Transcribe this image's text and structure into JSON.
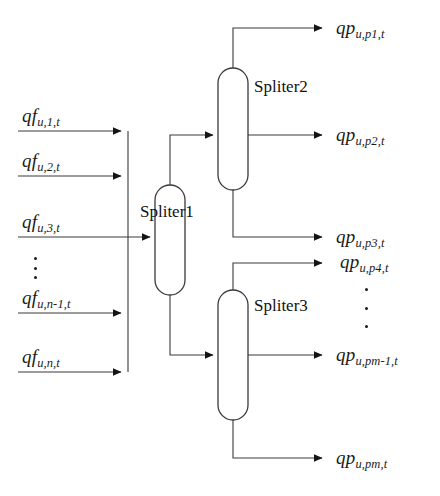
{
  "diagram": {
    "stroke_color": "#3a3a3a",
    "text_color": "#1a1a1a",
    "background": "#ffffff"
  },
  "blocks": [
    {
      "name": "Spliter1",
      "label": "Spliter1"
    },
    {
      "name": "Spliter2",
      "label": "Spliter2"
    },
    {
      "name": "Spliter3",
      "label": "Spliter3"
    }
  ],
  "inputs": [
    {
      "base": "qf",
      "sub": "u,1,t"
    },
    {
      "base": "qf",
      "sub": "u,2,t"
    },
    {
      "base": "qf",
      "sub": "u,3,t"
    },
    {
      "base": "qf",
      "sub": "u,n-1,t"
    },
    {
      "base": "qf",
      "sub": "u,n,t"
    }
  ],
  "outputs": [
    {
      "base": "qp",
      "sub": "u,p1,t"
    },
    {
      "base": "qp",
      "sub": "u,p2,t"
    },
    {
      "base": "qp",
      "sub": "u,p3,t"
    },
    {
      "base": "qp",
      "sub": "u,p4,t"
    },
    {
      "base": "qp",
      "sub": "u,pm-1,t"
    },
    {
      "base": "qp",
      "sub": "u,pm,t"
    }
  ],
  "ellipses": [
    {
      "name": "input-ellipsis",
      "dots": 3
    },
    {
      "name": "output-ellipsis",
      "dots": 3
    }
  ]
}
